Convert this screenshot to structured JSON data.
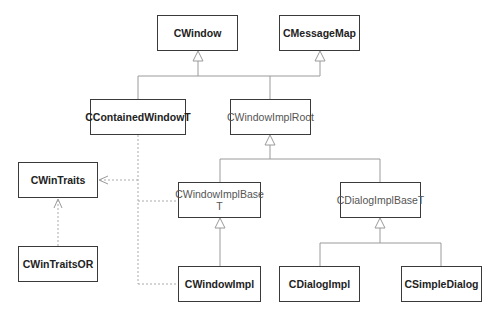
{
  "diagram": {
    "type": "UML class hierarchy",
    "colors": {
      "box_border": "#3a3a3a",
      "line": "#9a9a9a",
      "dashed_line": "#aaaaaa",
      "text": "#222222"
    },
    "nodes": [
      {
        "id": "cwindow",
        "label": "CWindow",
        "style": "bold",
        "x": 157,
        "y": 15,
        "w": 81,
        "h": 36
      },
      {
        "id": "cmessagemap",
        "label": "CMessageMap",
        "style": "bold",
        "x": 279,
        "y": 15,
        "w": 81,
        "h": 36
      },
      {
        "id": "ccontainedwindowt",
        "label": "CContainedWindowT",
        "style": "bold",
        "x": 90,
        "y": 99,
        "w": 96,
        "h": 36
      },
      {
        "id": "cwindowimplroot",
        "label": "CWindowImplRoot",
        "style": "normal",
        "x": 230,
        "y": 99,
        "w": 81,
        "h": 36
      },
      {
        "id": "cwintraits",
        "label": "CWinTraits",
        "style": "bold",
        "x": 18,
        "y": 162,
        "w": 80,
        "h": 36
      },
      {
        "id": "cwindowimplbaset",
        "label": "CWindowImplBase T",
        "style": "normal",
        "x": 178,
        "y": 182,
        "w": 83,
        "h": 36
      },
      {
        "id": "cdialogimplbaset",
        "label": "CDialogImplBaseT",
        "style": "normal",
        "x": 340,
        "y": 182,
        "w": 81,
        "h": 36
      },
      {
        "id": "cwintraitsor",
        "label": "CWinTraitsOR",
        "style": "bold",
        "x": 18,
        "y": 246,
        "w": 80,
        "h": 36
      },
      {
        "id": "cwindowimpl",
        "label": "CWindowImpl",
        "style": "bold",
        "x": 178,
        "y": 266,
        "w": 83,
        "h": 36
      },
      {
        "id": "cdialogimpl",
        "label": "CDialogImpl",
        "style": "bold",
        "x": 279,
        "y": 266,
        "w": 81,
        "h": 36
      },
      {
        "id": "csimpledialog",
        "label": "CSimpleDialog",
        "style": "bold",
        "x": 401,
        "y": 266,
        "w": 81,
        "h": 36
      }
    ],
    "edges": [
      {
        "from": "ccontainedwindowt",
        "to": "cwindow",
        "kind": "inheritance"
      },
      {
        "from": "cwindowimplroot",
        "to": "cwindow",
        "kind": "inheritance"
      },
      {
        "from": "cwindowimplroot",
        "to": "cmessagemap",
        "kind": "inheritance"
      },
      {
        "from": "cwindowimplbaset",
        "to": "cwindowimplroot",
        "kind": "inheritance"
      },
      {
        "from": "cdialogimplbaset",
        "to": "cwindowimplroot",
        "kind": "inheritance"
      },
      {
        "from": "cwindowimpl",
        "to": "cwindowimplbaset",
        "kind": "inheritance"
      },
      {
        "from": "cdialogimpl",
        "to": "cdialogimplbaset",
        "kind": "inheritance"
      },
      {
        "from": "csimpledialog",
        "to": "cdialogimplbaset",
        "kind": "inheritance"
      },
      {
        "from": "ccontainedwindowt",
        "to": "cwintraits",
        "kind": "dependency"
      },
      {
        "from": "cwindowimplbaset",
        "to": "cwintraits",
        "kind": "dependency"
      },
      {
        "from": "cwindowimpl",
        "to": "cwintraits",
        "kind": "dependency"
      },
      {
        "from": "cwintraitsor",
        "to": "cwintraits",
        "kind": "dependency"
      }
    ]
  },
  "labels": {
    "cwindow": "CWindow",
    "cmessagemap": "CMessageMap",
    "ccontainedwindowt": "CContainedWindowT",
    "cwindowimplroot": "CWindowImplRoot",
    "cwintraits": "CWinTraits",
    "cwindowimplbaset_line1": "CWindowImplBase",
    "cwindowimplbaset_line2": "T",
    "cdialogimplbaset": "CDialogImplBaseT",
    "cwintraitsor": "CWinTraitsOR",
    "cwindowimpl": "CWindowImpl",
    "cdialogimpl": "CDialogImpl",
    "csimpledialog": "CSimpleDialog"
  }
}
